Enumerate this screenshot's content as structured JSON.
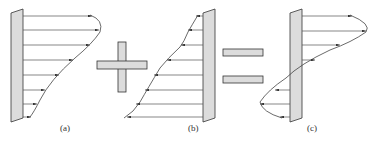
{
  "figure": {
    "panels": [
      {
        "id": "a",
        "label": "(a)",
        "description": "Velocity profile with forward arrows from wall, curved envelope"
      },
      {
        "id": "b",
        "label": "(b)",
        "description": "Linear-ish profile with arrows pointing left toward wall"
      },
      {
        "id": "c",
        "label": "(c)",
        "description": "Resulting profile with reversed flow near bottom"
      }
    ],
    "operators": {
      "plus": "+",
      "equals": "="
    },
    "caption": "",
    "colors": {
      "wall_fill": "#dcdcdc",
      "wall_stroke": "#333333",
      "arrow": "#333333",
      "operator_fill": "#dcdcdc"
    }
  }
}
